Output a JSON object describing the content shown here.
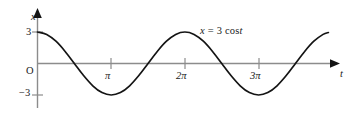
{
  "figure": {
    "axis_y_label": "x",
    "axis_x_label": "t",
    "origin_label": "O",
    "equation": {
      "lhs": "x",
      "equals": "=",
      "amplitude": "3",
      "function": "cos",
      "argument": "t",
      "full": "x = 3 cos t"
    },
    "y_ticks": [
      {
        "label": "3",
        "value": 3
      },
      {
        "label": "−3",
        "value": -3
      }
    ],
    "x_ticks": [
      {
        "coefficient": "",
        "symbol": "π",
        "label": "π",
        "value": 3.14159
      },
      {
        "coefficient": "2",
        "symbol": "π",
        "label": "2π",
        "value": 6.28319
      },
      {
        "coefficient": "3",
        "symbol": "π",
        "label": "3π",
        "value": 9.42478
      }
    ],
    "colors": {
      "curve": "#141414",
      "axis": "#8c8c8c",
      "arrowhead": "#141414",
      "tick": "#8c8c8c",
      "text": "#1a1a1a",
      "background": "#ffffff"
    }
  },
  "chart_data": {
    "type": "line",
    "title": "",
    "subtitle": "",
    "xlabel": "t",
    "ylabel": "x",
    "grid": false,
    "legend": null,
    "annotations": [
      {
        "text": "x = 3 cos t",
        "x": 7.4,
        "y": 3.6
      },
      {
        "text": "O",
        "x": -0.18,
        "y": -0.55
      }
    ],
    "xlim": [
      -0.35,
      12.6
    ],
    "ylim": [
      -3.9,
      3.9
    ],
    "xticks": [
      3.14159,
      6.28319,
      9.42478
    ],
    "xticklabels": [
      "π",
      "2π",
      "3π"
    ],
    "yticks": [
      -3,
      3
    ],
    "yticklabels": [
      "−3",
      "3"
    ],
    "series": [
      {
        "name": "x = 3 cos t",
        "equation": "x = 3*cos(t)",
        "amplitude": 3,
        "period": 6.28319,
        "color": "#141414",
        "x": [
          0,
          0.3927,
          0.7854,
          1.1781,
          1.5708,
          1.9635,
          2.3562,
          2.7489,
          3.14159,
          3.5343,
          3.927,
          4.3197,
          4.7124,
          5.1051,
          5.4978,
          5.8905,
          6.28319,
          6.6759,
          7.0686,
          7.4613,
          7.854,
          8.2467,
          8.6394,
          9.0321,
          9.42478,
          9.8175,
          10.2102,
          10.6029,
          10.9956,
          11.3883,
          11.781,
          12.1737,
          12.4
        ],
        "y": [
          3.0,
          2.772,
          2.121,
          1.148,
          0.0,
          -1.148,
          -2.121,
          -2.772,
          -3.0,
          -2.772,
          -2.121,
          -1.148,
          0.0,
          1.148,
          2.121,
          2.772,
          3.0,
          2.772,
          2.121,
          1.148,
          0.0,
          -1.148,
          -2.121,
          -2.772,
          -3.0,
          -2.772,
          -2.121,
          -1.148,
          0.0,
          1.148,
          2.121,
          2.772,
          2.95
        ]
      }
    ]
  }
}
